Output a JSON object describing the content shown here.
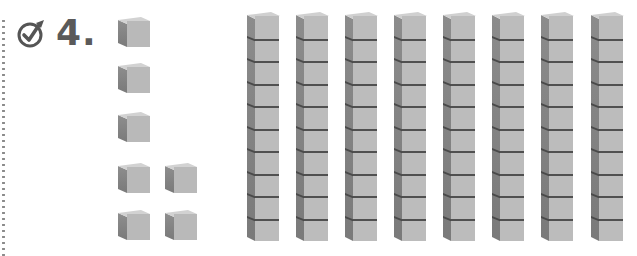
{
  "problem": {
    "number_label": "4.",
    "icon": "check-circle-icon",
    "colors": {
      "text": "#5a5a5a",
      "block_front": "#bcbcbc",
      "block_side": "#808080",
      "block_top": "#d0d0d0",
      "divider": "#4a4a4a"
    }
  },
  "base_ten_blocks": {
    "tens_rods": 8,
    "cubes_per_rod": 10,
    "ones_cubes": 7,
    "ones_layout": [
      [
        1
      ],
      [
        1
      ],
      [
        1
      ],
      [
        1,
        1
      ],
      [
        1,
        1
      ]
    ],
    "rod_left_positions": [
      247,
      296,
      345,
      394,
      443,
      492,
      541,
      591
    ],
    "ones_positions": [
      {
        "x": 118,
        "y": 17
      },
      {
        "x": 118,
        "y": 63
      },
      {
        "x": 118,
        "y": 112
      },
      {
        "x": 118,
        "y": 163
      },
      {
        "x": 165,
        "y": 163
      },
      {
        "x": 118,
        "y": 210
      },
      {
        "x": 165,
        "y": 210
      }
    ]
  }
}
